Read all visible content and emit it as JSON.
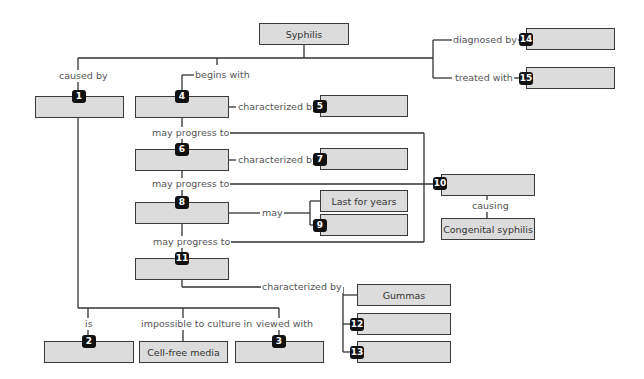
{
  "diagram": {
    "root": "Syphilis",
    "nodes": {
      "syphilis": "Syphilis",
      "last_for_years": "Last for years",
      "congenital_syphilis": "Congenital syphilis",
      "gummas": "Gummas",
      "cell_free_media": "Cell-free media"
    },
    "blank_markers": [
      "1",
      "2",
      "3",
      "4",
      "5",
      "6",
      "7",
      "8",
      "9",
      "10",
      "11",
      "12",
      "13",
      "14",
      "15"
    ],
    "links": {
      "caused_by": "caused by",
      "begins_with": "begins with",
      "diagnosed_by": "diagnosed by",
      "treated_with": "treated with",
      "characterized_by_4": "characterized by",
      "may_progress_4": "may progress to",
      "characterized_by_6": "characterized by",
      "may_progress_6": "may progress to",
      "may": "may",
      "may_progress_8": "may progress to",
      "causing": "causing",
      "characterized_by_11": "characterized by",
      "is": "is",
      "impossible_to_culture": "impossible to culture in",
      "viewed_with": "viewed with"
    },
    "colors": {
      "box_fill": "#dcdcdc",
      "box_border": "#3a3a3a",
      "marker": "#111111",
      "line": "#333333"
    }
  }
}
